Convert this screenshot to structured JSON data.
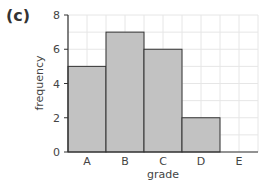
{
  "panel_label": "(c)",
  "chart_data": {
    "type": "bar",
    "title": "",
    "xlabel": "grade",
    "ylabel": "frequency",
    "categories": [
      "A",
      "B",
      "C",
      "D",
      "E"
    ],
    "values": [
      5,
      7,
      6,
      2,
      0
    ],
    "ylim": [
      0,
      8
    ],
    "yticks": [
      0,
      2,
      4,
      6,
      8
    ],
    "grid": true,
    "legend": null,
    "colors": {
      "bar_fill": "#c2c2c2",
      "bar_stroke": "#333333",
      "axis": "#333333",
      "grid": "#e6e6e6",
      "text": "#444444"
    }
  }
}
